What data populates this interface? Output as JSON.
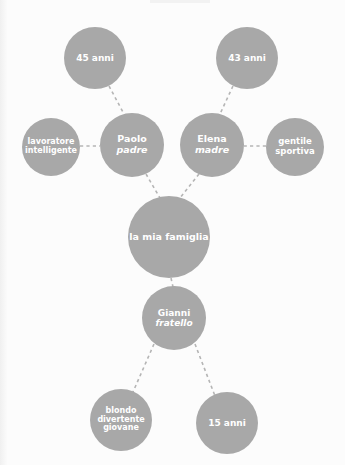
{
  "diagram": {
    "type": "mind-map",
    "title": "la mia famiglia",
    "language": "Italian",
    "style": {
      "node_fill": "#a8a8a8",
      "node_text_color": "#ffffff",
      "edge_color": "#b5b5b5",
      "edge_style": "dashed",
      "background": "#fcfcfc"
    },
    "nodes": [
      {
        "id": "padre_age",
        "lines": [
          {
            "text": "45 anni",
            "style": "bold"
          }
        ],
        "cx": 95,
        "cy": 58,
        "r": 31,
        "font_size": 9
      },
      {
        "id": "madre_age",
        "lines": [
          {
            "text": "43 anni",
            "style": "bold"
          }
        ],
        "cx": 247,
        "cy": 58,
        "r": 31,
        "font_size": 9
      },
      {
        "id": "padre_traits",
        "lines": [
          {
            "text": "lavoratore",
            "style": "bold"
          },
          {
            "text": "intelligente",
            "style": "bold"
          }
        ],
        "cx": 51,
        "cy": 147,
        "r": 29,
        "font_size": 8
      },
      {
        "id": "padre",
        "lines": [
          {
            "text": "Paolo",
            "style": "bold"
          },
          {
            "text": "padre",
            "style": "italic"
          }
        ],
        "cx": 132,
        "cy": 145,
        "r": 32,
        "font_size": 9.5
      },
      {
        "id": "madre",
        "lines": [
          {
            "text": "Elena",
            "style": "bold"
          },
          {
            "text": "madre",
            "style": "italic"
          }
        ],
        "cx": 212,
        "cy": 145,
        "r": 32,
        "font_size": 9.5
      },
      {
        "id": "madre_traits",
        "lines": [
          {
            "text": "gentile",
            "style": "bold"
          },
          {
            "text": "sportiva",
            "style": "bold"
          }
        ],
        "cx": 295,
        "cy": 147,
        "r": 29,
        "font_size": 8.5
      },
      {
        "id": "famiglia",
        "lines": [
          {
            "text": "la mia famiglia",
            "style": "bold"
          }
        ],
        "cx": 169,
        "cy": 237,
        "r": 41,
        "font_size": 9.5
      },
      {
        "id": "fratello",
        "lines": [
          {
            "text": "Gianni",
            "style": "bold"
          },
          {
            "text": "fratello",
            "style": "italic"
          }
        ],
        "cx": 174,
        "cy": 318,
        "r": 32,
        "font_size": 9
      },
      {
        "id": "fratello_traits",
        "lines": [
          {
            "text": "blondo",
            "style": "bold"
          },
          {
            "text": "divertente",
            "style": "bold"
          },
          {
            "text": "giovane",
            "style": "bold"
          }
        ],
        "cx": 121,
        "cy": 420,
        "r": 31,
        "font_size": 8
      },
      {
        "id": "fratello_age",
        "lines": [
          {
            "text": "15 anni",
            "style": "bold"
          }
        ],
        "cx": 227,
        "cy": 423,
        "r": 31,
        "font_size": 9
      }
    ],
    "edges": [
      {
        "from": "padre_age",
        "to": "padre",
        "x1": 109,
        "y1": 86,
        "x2": 124,
        "y2": 114
      },
      {
        "from": "madre_age",
        "to": "madre",
        "x1": 233,
        "y1": 86,
        "x2": 220,
        "y2": 114
      },
      {
        "from": "padre_traits",
        "to": "padre",
        "x1": 80,
        "y1": 146,
        "x2": 100,
        "y2": 146
      },
      {
        "from": "madre_traits",
        "to": "madre",
        "x1": 266,
        "y1": 146,
        "x2": 244,
        "y2": 146
      },
      {
        "from": "padre",
        "to": "famiglia",
        "x1": 146,
        "y1": 174,
        "x2": 160,
        "y2": 198
      },
      {
        "from": "madre",
        "to": "famiglia",
        "x1": 199,
        "y1": 174,
        "x2": 180,
        "y2": 198
      },
      {
        "from": "famiglia",
        "to": "fratello",
        "x1": 171,
        "y1": 278,
        "x2": 173,
        "y2": 287
      },
      {
        "from": "fratello",
        "to": "fratello_traits",
        "x1": 154,
        "y1": 344,
        "x2": 133,
        "y2": 392
      },
      {
        "from": "fratello",
        "to": "fratello_age",
        "x1": 195,
        "y1": 344,
        "x2": 215,
        "y2": 396
      }
    ]
  }
}
